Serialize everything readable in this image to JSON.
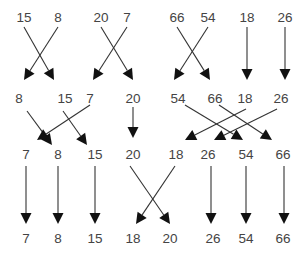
{
  "diagram": {
    "type": "merge-sort-network",
    "colors": {
      "text": "#444444",
      "line": "#333333",
      "arrowhead": "#111111",
      "background": "#ffffff"
    },
    "rows": [
      {
        "y": 22,
        "items": [
          {
            "value": "15",
            "x": 24
          },
          {
            "value": "8",
            "x": 58
          },
          {
            "value": "20",
            "x": 101
          },
          {
            "value": "7",
            "x": 127
          },
          {
            "value": "66",
            "x": 177
          },
          {
            "value": "54",
            "x": 208
          },
          {
            "value": "18",
            "x": 247
          },
          {
            "value": "26",
            "x": 285
          }
        ]
      },
      {
        "y": 103,
        "items": [
          {
            "value": "8",
            "x": 19
          },
          {
            "value": "15",
            "x": 65
          },
          {
            "value": "7",
            "x": 90
          },
          {
            "value": "20",
            "x": 133
          },
          {
            "value": "54",
            "x": 178
          },
          {
            "value": "66",
            "x": 215
          },
          {
            "value": "18",
            "x": 245
          },
          {
            "value": "26",
            "x": 281
          }
        ]
      },
      {
        "y": 159,
        "items": [
          {
            "value": "7",
            "x": 26
          },
          {
            "value": "8",
            "x": 58
          },
          {
            "value": "15",
            "x": 95
          },
          {
            "value": "20",
            "x": 133
          },
          {
            "value": "18",
            "x": 176
          },
          {
            "value": "26",
            "x": 208
          },
          {
            "value": "54",
            "x": 246
          },
          {
            "value": "66",
            "x": 283
          }
        ]
      },
      {
        "y": 243,
        "items": [
          {
            "value": "7",
            "x": 26
          },
          {
            "value": "8",
            "x": 58
          },
          {
            "value": "15",
            "x": 95
          },
          {
            "value": "18",
            "x": 133
          },
          {
            "value": "20",
            "x": 170
          },
          {
            "value": "26",
            "x": 213
          },
          {
            "value": "54",
            "x": 246
          },
          {
            "value": "66",
            "x": 283
          }
        ]
      }
    ],
    "edges": [
      {
        "from": [
          24,
          27
        ],
        "to": [
          54,
          80
        ]
      },
      {
        "from": [
          58,
          27
        ],
        "to": [
          24,
          80
        ]
      },
      {
        "from": [
          101,
          27
        ],
        "to": [
          133,
          80
        ]
      },
      {
        "from": [
          127,
          27
        ],
        "to": [
          93,
          80
        ]
      },
      {
        "from": [
          177,
          27
        ],
        "to": [
          210,
          80
        ]
      },
      {
        "from": [
          208,
          27
        ],
        "to": [
          174,
          80
        ]
      },
      {
        "from": [
          247,
          27
        ],
        "to": [
          247,
          80
        ]
      },
      {
        "from": [
          285,
          27
        ],
        "to": [
          285,
          80
        ]
      },
      {
        "from": [
          27,
          111
        ],
        "to": [
          52,
          145
        ]
      },
      {
        "from": [
          63,
          111
        ],
        "to": [
          87,
          145
        ]
      },
      {
        "from": [
          90,
          105
        ],
        "to": [
          37,
          140
        ]
      },
      {
        "from": [
          133,
          107
        ],
        "to": [
          133,
          138
        ]
      },
      {
        "from": [
          185,
          105
        ],
        "to": [
          243,
          140
        ]
      },
      {
        "from": [
          219,
          105
        ],
        "to": [
          272,
          140
        ]
      },
      {
        "from": [
          246,
          109
        ],
        "to": [
          185,
          140
        ]
      },
      {
        "from": [
          277,
          109
        ],
        "to": [
          214,
          140
        ]
      },
      {
        "from": [
          26,
          166
        ],
        "to": [
          26,
          224
        ]
      },
      {
        "from": [
          58,
          166
        ],
        "to": [
          58,
          224
        ]
      },
      {
        "from": [
          95,
          166
        ],
        "to": [
          95,
          224
        ]
      },
      {
        "from": [
          130,
          166
        ],
        "to": [
          170,
          224
        ]
      },
      {
        "from": [
          175,
          166
        ],
        "to": [
          136,
          224
        ]
      },
      {
        "from": [
          211,
          166
        ],
        "to": [
          211,
          224
        ]
      },
      {
        "from": [
          246,
          166
        ],
        "to": [
          246,
          224
        ]
      },
      {
        "from": [
          284,
          166
        ],
        "to": [
          284,
          224
        ]
      }
    ]
  }
}
